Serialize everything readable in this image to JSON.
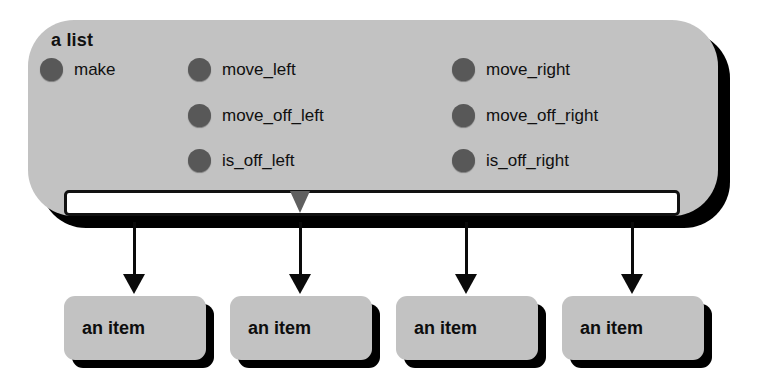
{
  "diagram": {
    "title": "a list",
    "background_color": "#ffffff",
    "box_fill_color": "#c2c2c2",
    "shadow_color": "#000000",
    "bullet_color": "#585858",
    "slot_fill_color": "#ffffff",
    "marker_color": "#5f5f5f",
    "arrow_color": "#0a0a0a"
  },
  "list_box": {
    "title": "a list",
    "methods": [
      {
        "label": "make",
        "column": 1,
        "row": 1
      },
      {
        "label": "move_left",
        "column": 2,
        "row": 1
      },
      {
        "label": "move_off_left",
        "column": 2,
        "row": 2
      },
      {
        "label": "is_off_left",
        "column": 2,
        "row": 3
      },
      {
        "label": "move_right",
        "column": 3,
        "row": 1
      },
      {
        "label": "move_off_right",
        "column": 3,
        "row": 2
      },
      {
        "label": "is_off_right",
        "column": 3,
        "row": 3
      }
    ],
    "slot": {
      "name": "contents-bar",
      "marker": "cursor-marker"
    }
  },
  "items": [
    {
      "label": "an item"
    },
    {
      "label": "an item"
    },
    {
      "label": "an item"
    },
    {
      "label": "an item"
    }
  ],
  "arrows": [
    {
      "name": "arrow-to-item-1"
    },
    {
      "name": "arrow-to-item-2"
    },
    {
      "name": "arrow-to-item-3"
    },
    {
      "name": "arrow-to-item-4"
    }
  ]
}
